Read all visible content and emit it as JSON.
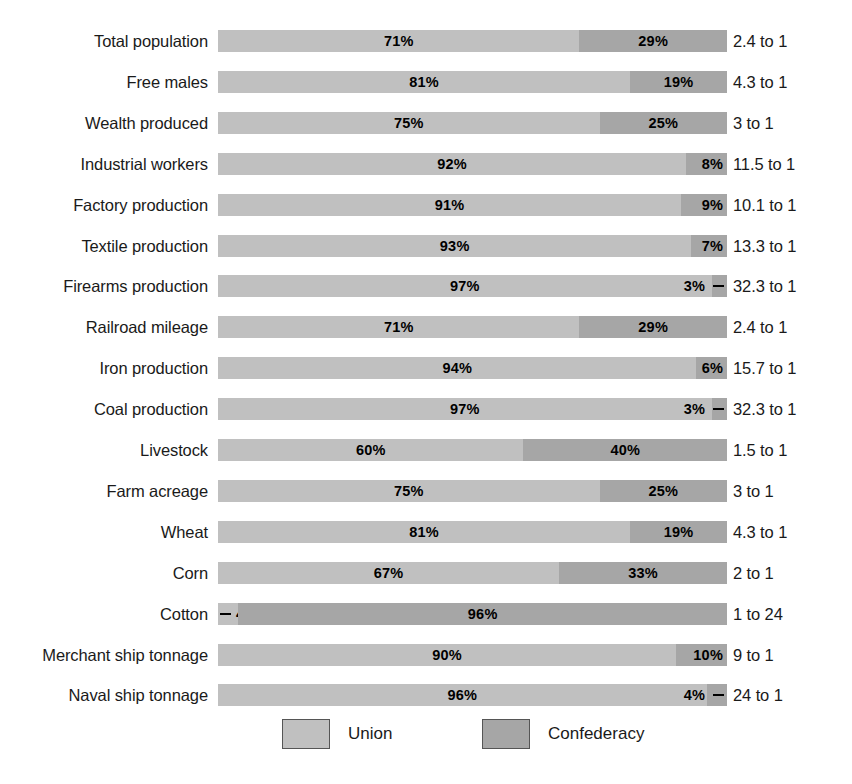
{
  "chart_data": {
    "type": "bar",
    "subtype": "stacked-horizontal-100-percent",
    "title": "",
    "xlabel": "",
    "ylabel": "",
    "xlim": [
      0,
      100
    ],
    "grid": false,
    "legend_position": "bottom",
    "legend": [
      "Union",
      "Confederacy"
    ],
    "colors": {
      "union": "#c0c0c0",
      "confederacy": "#a6a6a6",
      "text": "#1a1a1a",
      "background": "#ffffff"
    },
    "categories": [
      "Total population",
      "Free males",
      "Wealth produced",
      "Industrial workers",
      "Factory production",
      "Textile production",
      "Firearms production",
      "Railroad mileage",
      "Iron production",
      "Coal production",
      "Livestock",
      "Farm acreage",
      "Wheat",
      "Corn",
      "Cotton",
      "Merchant ship tonnage",
      "Naval ship tonnage"
    ],
    "series": [
      {
        "name": "Union",
        "values": [
          71,
          81,
          75,
          92,
          91,
          93,
          97,
          71,
          94,
          97,
          60,
          75,
          81,
          67,
          4,
          90,
          96
        ]
      },
      {
        "name": "Confederacy",
        "values": [
          29,
          19,
          25,
          8,
          9,
          7,
          3,
          29,
          6,
          3,
          40,
          25,
          19,
          33,
          96,
          10,
          4
        ]
      }
    ],
    "annotations": [
      "2.4 to 1",
      "4.3 to 1",
      "3 to 1",
      "11.5 to 1",
      "10.1 to 1",
      "13.3 to 1",
      "32.3 to 1",
      "2.4 to 1",
      "15.7 to 1",
      "32.3 to 1",
      "1.5 to 1",
      "3 to 1",
      "4.3 to 1",
      "2 to 1",
      "1 to 24",
      "9 to 1",
      "24 to 1"
    ]
  },
  "rows": [
    {
      "label": "Total population",
      "union": 71,
      "conf": 29,
      "union_text": "71%",
      "conf_text": "29%",
      "ratio": "2.4 to 1",
      "union_pos": "center",
      "conf_pos": "center",
      "union_leader": false,
      "conf_leader": false
    },
    {
      "label": "Free males",
      "union": 81,
      "conf": 19,
      "union_text": "81%",
      "conf_text": "19%",
      "ratio": "4.3 to 1",
      "union_pos": "center",
      "conf_pos": "center",
      "union_leader": false,
      "conf_leader": false
    },
    {
      "label": "Wealth produced",
      "union": 75,
      "conf": 25,
      "union_text": "75%",
      "conf_text": "25%",
      "ratio": "3 to 1",
      "union_pos": "center",
      "conf_pos": "center",
      "union_leader": false,
      "conf_leader": false
    },
    {
      "label": "Industrial workers",
      "union": 92,
      "conf": 8,
      "union_text": "92%",
      "conf_text": "8%",
      "ratio": "11.5 to 1",
      "union_pos": "center",
      "conf_pos": "right-edge",
      "union_leader": false,
      "conf_leader": false
    },
    {
      "label": "Factory production",
      "union": 91,
      "conf": 9,
      "union_text": "91%",
      "conf_text": "9%",
      "ratio": "10.1 to 1",
      "union_pos": "center",
      "conf_pos": "right-edge",
      "union_leader": false,
      "conf_leader": false
    },
    {
      "label": "Textile production",
      "union": 93,
      "conf": 7,
      "union_text": "93%",
      "conf_text": "7%",
      "ratio": "13.3 to 1",
      "union_pos": "center",
      "conf_pos": "right-edge",
      "union_leader": false,
      "conf_leader": false
    },
    {
      "label": "Firearms production",
      "union": 97,
      "conf": 3,
      "union_text": "97%",
      "conf_text": "3%",
      "ratio": "32.3 to 1",
      "union_pos": "center",
      "conf_pos": "right-edge",
      "union_leader": false,
      "conf_leader": true
    },
    {
      "label": "Railroad mileage",
      "union": 71,
      "conf": 29,
      "union_text": "71%",
      "conf_text": "29%",
      "ratio": "2.4 to 1",
      "union_pos": "center",
      "conf_pos": "center",
      "union_leader": false,
      "conf_leader": false
    },
    {
      "label": "Iron production",
      "union": 94,
      "conf": 6,
      "union_text": "94%",
      "conf_text": "6%",
      "ratio": "15.7 to 1",
      "union_pos": "center",
      "conf_pos": "right-edge",
      "union_leader": false,
      "conf_leader": false
    },
    {
      "label": "Coal production",
      "union": 97,
      "conf": 3,
      "union_text": "97%",
      "conf_text": "3%",
      "ratio": "32.3 to 1",
      "union_pos": "center",
      "conf_pos": "right-edge",
      "union_leader": false,
      "conf_leader": true
    },
    {
      "label": "Livestock",
      "union": 60,
      "conf": 40,
      "union_text": "60%",
      "conf_text": "40%",
      "ratio": "1.5 to 1",
      "union_pos": "center",
      "conf_pos": "center",
      "union_leader": false,
      "conf_leader": false
    },
    {
      "label": "Farm acreage",
      "union": 75,
      "conf": 25,
      "union_text": "75%",
      "conf_text": "25%",
      "ratio": "3 to 1",
      "union_pos": "center",
      "conf_pos": "center",
      "union_leader": false,
      "conf_leader": false
    },
    {
      "label": "Wheat",
      "union": 81,
      "conf": 19,
      "union_text": "81%",
      "conf_text": "19%",
      "ratio": "4.3 to 1",
      "union_pos": "center",
      "conf_pos": "center",
      "union_leader": false,
      "conf_leader": false
    },
    {
      "label": "Corn",
      "union": 67,
      "conf": 33,
      "union_text": "67%",
      "conf_text": "33%",
      "ratio": "2 to 1",
      "union_pos": "center",
      "conf_pos": "center",
      "union_leader": false,
      "conf_leader": false
    },
    {
      "label": "Cotton",
      "union": 4,
      "conf": 96,
      "union_text": "4%",
      "conf_text": "96%",
      "ratio": "1 to 24",
      "union_pos": "left-edge",
      "conf_pos": "center",
      "union_leader": true,
      "conf_leader": false
    },
    {
      "label": "Merchant ship tonnage",
      "union": 90,
      "conf": 10,
      "union_text": "90%",
      "conf_text": "10%",
      "ratio": "9 to 1",
      "union_pos": "center",
      "conf_pos": "right-edge",
      "union_leader": false,
      "conf_leader": false
    },
    {
      "label": "Naval ship tonnage",
      "union": 96,
      "conf": 4,
      "union_text": "96%",
      "conf_text": "4%",
      "ratio": "24 to 1",
      "union_pos": "center",
      "conf_pos": "right-edge",
      "union_leader": false,
      "conf_leader": true
    }
  ],
  "legend": {
    "union_label": "Union",
    "confederacy_label": "Confederacy"
  }
}
